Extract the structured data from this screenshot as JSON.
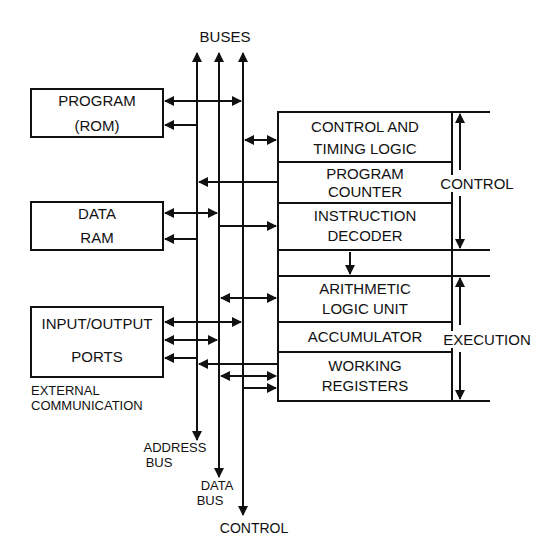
{
  "title": "BUSES",
  "left_blocks": {
    "program": {
      "line1": "PROGRAM",
      "line2": "(ROM)"
    },
    "data_ram": {
      "line1": "DATA",
      "line2": "RAM"
    },
    "io": {
      "line1": "INPUT/OUTPUT",
      "line2": "PORTS"
    }
  },
  "external_label": {
    "line1": "EXTERNAL",
    "line2": "COMMUNICATION"
  },
  "bus_labels": {
    "address": {
      "line1": "ADDRESS",
      "line2": "BUS"
    },
    "data": {
      "line1": "DATA",
      "line2": "BUS"
    },
    "control": "CONTROL"
  },
  "cpu_blocks": [
    {
      "line1": "CONTROL AND",
      "line2": "TIMING LOGIC"
    },
    {
      "line1": "PROGRAM",
      "line2": "COUNTER"
    },
    {
      "line1": "INSTRUCTION",
      "line2": "DECODER"
    },
    {
      "line1": "ARITHMETIC",
      "line2": "LOGIC UNIT"
    },
    {
      "line1": "ACCUMULATOR"
    },
    {
      "line1": "WORKING",
      "line2": "REGISTERS"
    }
  ],
  "sections": {
    "control": "CONTROL",
    "execution": "EXECUTION"
  }
}
